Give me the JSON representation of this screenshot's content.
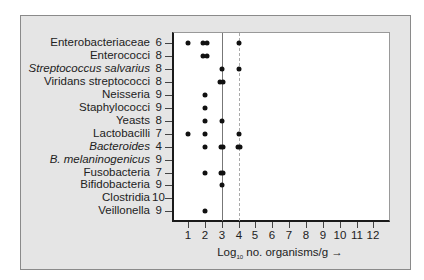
{
  "chart_data": {
    "type": "scatter",
    "title": "",
    "xlabel": "Log10 no. organisms/g →",
    "ylabel": "",
    "xlim": [
      0,
      12.5
    ],
    "x_ticks": [
      1,
      2,
      3,
      4,
      5,
      6,
      7,
      8,
      9,
      10,
      11,
      12
    ],
    "reference_lines": [
      {
        "x": 3,
        "style": "solid"
      },
      {
        "x": 4,
        "style": "dashed"
      }
    ],
    "grid": false,
    "legend": null,
    "categories": [
      {
        "label": "Enterobacteriaceae",
        "count": "6",
        "italic": false,
        "values": [
          1,
          1.9,
          2.1,
          4
        ]
      },
      {
        "label": "Enterococci",
        "count": "8",
        "italic": false,
        "values": [
          1.9,
          2.1
        ]
      },
      {
        "label": "Streptococcus salvarius",
        "count": "8",
        "italic": true,
        "values": [
          3,
          4
        ]
      },
      {
        "label": "Viridans streptococci",
        "count": "8",
        "italic": false,
        "values": [
          2.9,
          3.1
        ]
      },
      {
        "label": "Neisseria",
        "count": "9",
        "italic": false,
        "values": [
          2
        ]
      },
      {
        "label": "Staphylococci",
        "count": "9",
        "italic": false,
        "values": [
          2
        ]
      },
      {
        "label": "Yeasts",
        "count": "8",
        "italic": false,
        "values": [
          2,
          3
        ]
      },
      {
        "label": "Lactobacilli",
        "count": "7",
        "italic": false,
        "values": [
          1,
          2,
          4
        ]
      },
      {
        "label": "Bacteroides",
        "count": "4",
        "italic": true,
        "values": [
          2,
          2.95,
          3.1,
          3.95,
          4.1
        ]
      },
      {
        "label": "B.  melaninogenicus",
        "count": "9",
        "italic": true,
        "values": []
      },
      {
        "label": "Fusobacteria",
        "count": "7",
        "italic": false,
        "values": [
          2,
          2.95,
          3.1
        ]
      },
      {
        "label": "Bifidobacteria",
        "count": "9",
        "italic": false,
        "values": [
          3
        ]
      },
      {
        "label": "Clostridia",
        "count": "10",
        "italic": false,
        "values": []
      },
      {
        "label": "Veillonella",
        "count": "9",
        "italic": false,
        "values": [
          2
        ]
      }
    ]
  },
  "axis": {
    "title_prefix": "Log",
    "title_sub": "10",
    "title_suffix": " no. organisms/g →"
  }
}
